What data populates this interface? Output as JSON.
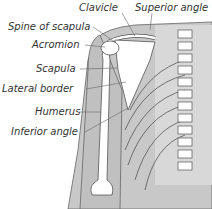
{
  "diagram": {
    "labels": [
      {
        "id": "clavicle",
        "text": "Clavicle",
        "x": 79,
        "y": 2
      },
      {
        "id": "superior-angle",
        "text": "Superior angle",
        "x": 135,
        "y": 2
      },
      {
        "id": "spine-of-scapula",
        "text": "Spine of scapula",
        "x": 8,
        "y": 21
      },
      {
        "id": "acromion",
        "text": "Acromion",
        "x": 32,
        "y": 39
      },
      {
        "id": "scapula",
        "text": "Scapula",
        "x": 36,
        "y": 63
      },
      {
        "id": "lateral-border",
        "text": "Lateral border",
        "x": 2,
        "y": 83
      },
      {
        "id": "humerus",
        "text": "Humerus",
        "x": 35,
        "y": 106
      },
      {
        "id": "inferior-angle",
        "text": "Inferior angle",
        "x": 11,
        "y": 126
      }
    ],
    "colors": {
      "body": "#c8c8c8",
      "bone": "#ffffff",
      "outline": "#555555",
      "text": "#333333"
    }
  }
}
